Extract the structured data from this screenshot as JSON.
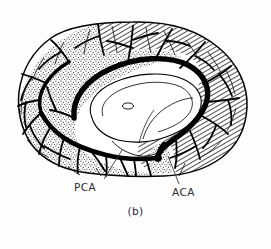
{
  "figure": {
    "caption": "(b)",
    "title_alt": "Mid-sagittal view of cerebral hemisphere showing arterial territories",
    "background_color": "#fdfdfd",
    "ink_color": "#000000",
    "labels": [
      {
        "id": "pca",
        "text": "PCA",
        "meaning": "posterior-cerebral-artery",
        "territory_pattern": "stipple",
        "leader_from": [
          104,
          180
        ],
        "leader_to": [
          122,
          150
        ]
      },
      {
        "id": "aca",
        "text": "ACA",
        "meaning": "anterior-cerebral-artery",
        "territory_pattern": "diagonal-hatch",
        "leader_from": [
          178,
          185
        ],
        "leader_to": [
          167,
          156
        ]
      }
    ],
    "territories": [
      {
        "name": "ACA territory",
        "pattern": "diagonal hatching",
        "region": "superior and anterior (frontal / paracentral) cortex"
      },
      {
        "name": "PCA territory",
        "pattern": "fine stipple",
        "region": "posterior and inferior (occipital / temporal) cortex"
      },
      {
        "name": "corpus callosum and deep structures",
        "pattern": "unshaded white",
        "region": "central"
      }
    ],
    "vessels": [
      "pericallosal artery (thick arc over corpus callosum)",
      "callosomarginal branch",
      "posterior cerebral artery trunk (inferior thick vessel)",
      "cortical branches"
    ]
  }
}
